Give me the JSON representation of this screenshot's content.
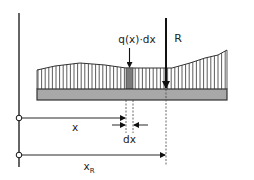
{
  "diagram": {
    "labels": {
      "load_element": "q(x)·dx",
      "resultant": "R",
      "position": "x",
      "element_width": "dx",
      "resultant_position_base": "x",
      "resultant_position_sub": "R"
    },
    "colors": {
      "line": "#111111",
      "beam_fill": "#a8a8a8",
      "beam_stroke": "#333333",
      "strip_fill": "#7a7a7a",
      "hatch": "#333333",
      "dashed": "#444444"
    },
    "elements": [
      "reference-axis",
      "distributed-load",
      "beam",
      "load-element-strip",
      "resultant-force-arrow",
      "dimension-x",
      "dimension-dx",
      "dimension-xR"
    ]
  }
}
